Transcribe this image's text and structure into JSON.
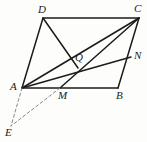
{
  "figure": {
    "kind": "geometry-diagram",
    "background_color": "#fdfdfc",
    "stroke_color": "#1b1b1b",
    "dashed_stroke_color": "#8a8a8a",
    "canvas": {
      "width": 147,
      "height": 142
    }
  },
  "points": [
    {
      "id": "D",
      "label": "D",
      "x": 43,
      "y": 18,
      "label_x": 38,
      "label_y": 4
    },
    {
      "id": "C",
      "label": "C",
      "x": 139,
      "y": 18,
      "label_x": 134,
      "label_y": 3
    },
    {
      "id": "Q",
      "label": "Q",
      "x": 78,
      "y": 68,
      "label_x": 75,
      "label_y": 52
    },
    {
      "id": "N",
      "label": "N",
      "x": 131,
      "y": 57,
      "label_x": 134,
      "label_y": 50
    },
    {
      "id": "A",
      "label": "A",
      "x": 22,
      "y": 88,
      "label_x": 10,
      "label_y": 81
    },
    {
      "id": "M",
      "label": "M",
      "x": 60,
      "y": 88,
      "label_x": 58,
      "label_y": 90
    },
    {
      "id": "B",
      "label": "B",
      "x": 118,
      "y": 88,
      "label_x": 116,
      "label_y": 90
    },
    {
      "id": "E",
      "label": "E",
      "x": 11,
      "y": 126,
      "label_x": 5,
      "label_y": 127
    }
  ],
  "segments": [
    {
      "name": "side-AD",
      "from": "A",
      "to": "D",
      "style": "solid",
      "width": 1.5
    },
    {
      "name": "side-DC",
      "from": "D",
      "to": "C",
      "style": "solid",
      "width": 1.5
    },
    {
      "name": "side-CB",
      "from": "C",
      "to": "B",
      "style": "solid",
      "width": 1.5
    },
    {
      "name": "side-AB",
      "from": "A",
      "to": "B",
      "style": "solid",
      "width": 1.5
    },
    {
      "name": "segment-DQ",
      "from": "D",
      "to": "Q",
      "style": "solid",
      "width": 1.5
    },
    {
      "name": "diagonal-AC",
      "from": "A",
      "to": "C",
      "style": "solid",
      "width": 1.5
    },
    {
      "name": "segment-AN",
      "from": "A",
      "to": "N",
      "style": "solid",
      "width": 1.5
    },
    {
      "name": "segment-CM",
      "from": "C",
      "to": "M",
      "style": "solid",
      "width": 1.5
    },
    {
      "name": "dashed-AE",
      "from": "A",
      "to": "E",
      "style": "dashed",
      "width": 1
    },
    {
      "name": "dashed-ME",
      "from": "M",
      "to": "E",
      "style": "dashed",
      "width": 1
    }
  ]
}
